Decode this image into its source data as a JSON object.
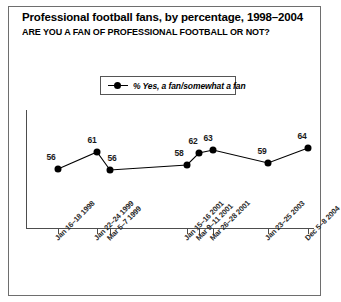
{
  "chart_data": {
    "type": "line",
    "title": "Professional football fans, by percentage, 1998–2004",
    "subtitle": "ARE YOU A FAN OF PROFESSIONAL FOOTBALL OR NOT?",
    "xlabel": "",
    "ylabel": "",
    "legend": {
      "position": "top-center",
      "entries": [
        "% Yes, a fan/somewhat a fan"
      ]
    },
    "grid": false,
    "categories": [
      "Jan 16–18 1998",
      "Jan 22–24 1999",
      "Mar 5–7 1999",
      "Jan 15–16 2001",
      "Mar 9–11 2001",
      "Mar 26–28 2001",
      "Jan 23–25 2003",
      "Dec 5–8 2004"
    ],
    "series": [
      {
        "name": "% Yes, a fan/somewhat a fan",
        "values": [
          56,
          61,
          56,
          58,
          62,
          63,
          59,
          64
        ]
      }
    ],
    "ylim": [
      40,
      72
    ],
    "point_labels": [
      "56",
      "61",
      "56",
      "58",
      "62",
      "63",
      "59",
      "64"
    ],
    "points": [
      {
        "label": "Jan 16–18 1998",
        "value": 56,
        "px": 58,
        "py": 169,
        "lx": 51,
        "ly": 162,
        "tick": 58
      },
      {
        "label": "Jan 22–24 1999",
        "value": 61,
        "px": 97,
        "py": 152,
        "lx": 92,
        "ly": 145,
        "tick": 97
      },
      {
        "label": "Mar 5–7 1999",
        "value": 56,
        "px": 110,
        "py": 170,
        "lx": 112,
        "ly": 163,
        "tick": 110
      },
      {
        "label": "Jan 15–16 2001",
        "value": 58,
        "px": 187,
        "py": 165,
        "lx": 179,
        "ly": 158,
        "tick": 187
      },
      {
        "label": "Mar 9–11 2001",
        "value": 62,
        "px": 199,
        "py": 153,
        "lx": 193,
        "ly": 146,
        "tick": 199
      },
      {
        "label": "Mar 26–28 2001",
        "value": 63,
        "px": 213,
        "py": 150,
        "lx": 208,
        "ly": 143,
        "tick": 213
      },
      {
        "label": "Jan 23–25 2003",
        "value": 59,
        "px": 268,
        "py": 163,
        "lx": 262,
        "ly": 156,
        "tick": 268
      },
      {
        "label": "Dec 5–8 2004",
        "value": 64,
        "px": 308,
        "py": 148,
        "lx": 302,
        "ly": 141,
        "tick": 308
      }
    ],
    "xtick_label_positions": [
      {
        "x": 53,
        "y": 236
      },
      {
        "x": 92,
        "y": 236
      },
      {
        "x": 105,
        "y": 236
      },
      {
        "x": 182,
        "y": 236
      },
      {
        "x": 194,
        "y": 236
      },
      {
        "x": 208,
        "y": 236
      },
      {
        "x": 263,
        "y": 236
      },
      {
        "x": 303,
        "y": 236
      }
    ],
    "colors": {
      "line": "#000000",
      "marker": "#000000",
      "axis": "#4d4d4d",
      "frame": "#6e6e6e",
      "background": "#ffffff",
      "text": "#000000"
    }
  }
}
